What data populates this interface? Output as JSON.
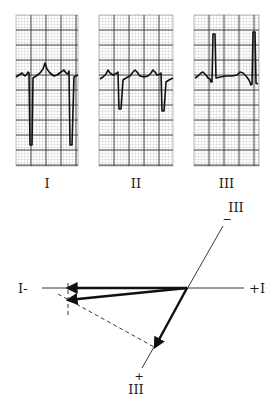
{
  "figure": {
    "strips": [
      {
        "label": "I",
        "x": 16,
        "y": 15,
        "w": 62,
        "h": 151,
        "trace": "16,77 19,75 22,73 25,76 27,74 28,72 29,73 30,145 32,145 33,78 36,76 40,73 43,69 45,63 47,69 50,73 54,76 57,75 61,72 64,70 66,73 68,74 69,71 70,145 72,145 74,77 76,76 78,75"
      },
      {
        "label": "II",
        "x": 99,
        "y": 15,
        "w": 74,
        "h": 151,
        "trace": "100,79 103,77 106,74 108,70 110,73 113,75 115,74 117,73 118,72 119,109 121,109 123,80 126,78 130,76 133,72 135,70 137,72 140,76 144,77 148,76 151,73 153,70 155,72 157,75 160,74 161,73 162,111 164,111 166,82 169,80 173,78"
      },
      {
        "label": "III",
        "x": 194,
        "y": 15,
        "w": 65,
        "h": 151,
        "trace": "195,78 198,76 201,73 203,72 206,75 208,78 210,79 211,82 212,82 213,34 215,34 216,78 220,77 226,76 232,76 237,75 240,72 243,73 246,76 249,80 251,85 252,84 253,32 255,32 256,83 258,84"
      }
    ],
    "vector_diagram": {
      "origin": [
        187,
        288
      ],
      "lead_I_axis": {
        "from": [
          42,
          288
        ],
        "to": [
          244,
          288
        ],
        "neg_label": "I-",
        "pos_label": "+I"
      },
      "lead_III_axis": {
        "from": [
          223,
          226
        ],
        "to": [
          142,
          368
        ],
        "label_top": "III",
        "sign_top": "−",
        "label_bottom": "III",
        "sign_bottom": "+"
      },
      "vectors": [
        {
          "name": "lead-I-vector",
          "to": [
            68,
            288
          ]
        },
        {
          "name": "mean-axis-vector",
          "to": [
            68,
            300
          ]
        },
        {
          "name": "lead-III-vector",
          "to": [
            155,
            347
          ]
        }
      ],
      "dashed_lines": [
        {
          "name": "lead-I-perpendicular",
          "from": [
            68,
            283
          ],
          "to": [
            68,
            316
          ]
        },
        {
          "name": "lead-III-perpendicular",
          "from": [
            58,
            294
          ],
          "to": [
            156,
            348
          ]
        }
      ]
    }
  }
}
